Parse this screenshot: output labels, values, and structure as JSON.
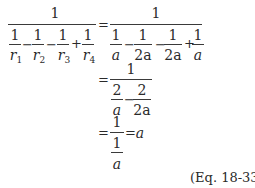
{
  "equation": {
    "row1": {
      "lhs": {
        "numerator": "1",
        "terms": [
          {
            "num": "1",
            "den_var": "r",
            "den_sub": "1"
          },
          {
            "num": "1",
            "den_var": "r",
            "den_sub": "2"
          },
          {
            "num": "1",
            "den_var": "r",
            "den_sub": "3"
          },
          {
            "num": "1",
            "den_var": "r",
            "den_sub": "4"
          }
        ],
        "ops": [
          "−",
          "−",
          "+"
        ]
      },
      "equals": "=",
      "rhs": {
        "numerator": "1",
        "terms": [
          {
            "num": "1",
            "den": "a"
          },
          {
            "num": "1",
            "den": "2a"
          },
          {
            "num": "1",
            "den": "2a"
          },
          {
            "num": "1",
            "den": "a"
          }
        ],
        "ops": [
          "−",
          "−",
          "+"
        ]
      }
    },
    "row2": {
      "equals": "=",
      "numerator": "1",
      "terms": [
        {
          "num": "2",
          "den": "a"
        },
        {
          "num": "2",
          "den": "2a"
        }
      ],
      "ops": [
        "−"
      ]
    },
    "row3": {
      "equals": "=",
      "numerator": "1",
      "inner": {
        "num": "1",
        "den": "a"
      },
      "equals2": "=",
      "result": "a"
    },
    "label": "(Eq. 18-33)"
  }
}
